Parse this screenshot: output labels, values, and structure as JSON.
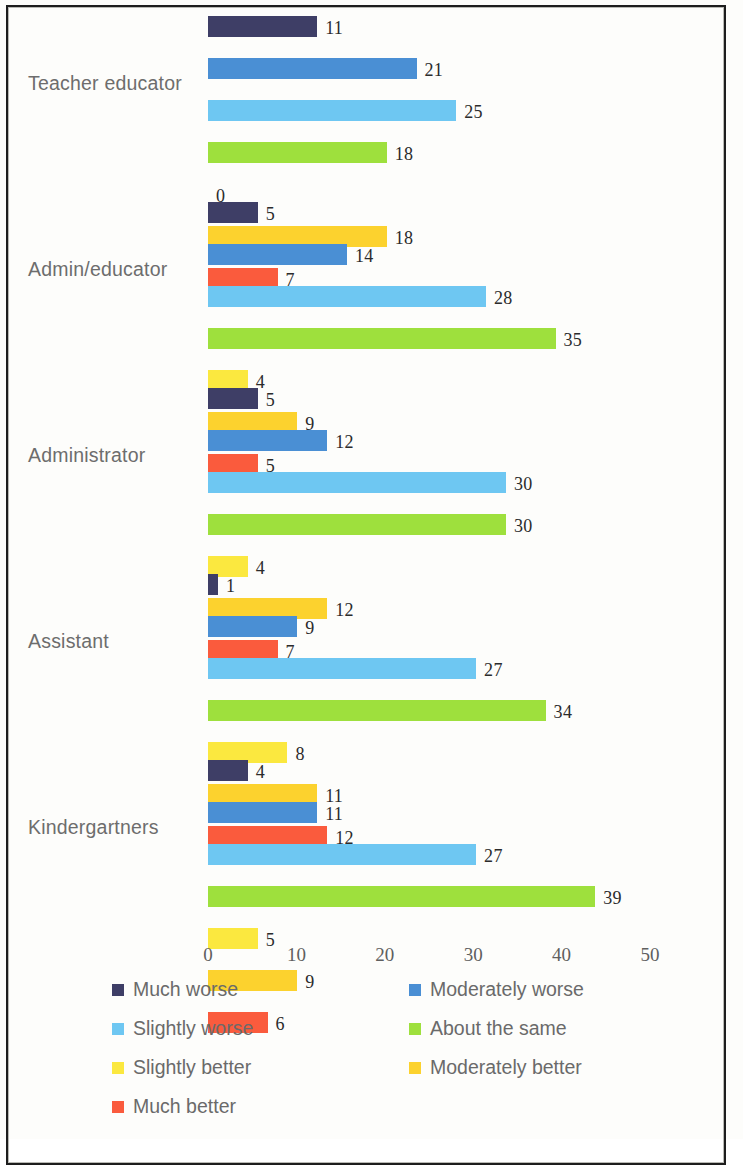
{
  "chart_data": {
    "type": "bar",
    "orientation": "horizontal",
    "title": "",
    "xlabel": "",
    "ylabel": "",
    "xlim": [
      0,
      50
    ],
    "xticks": [
      0,
      10,
      20,
      30,
      40,
      50
    ],
    "grid": false,
    "legend_position": "bottom",
    "categories": [
      "Teacher educator",
      "Admin/educator",
      "Administrator",
      "Assistant",
      "Kindergartners"
    ],
    "series": [
      {
        "name": "Much worse",
        "color": "#3e3e66",
        "values": [
          11,
          5,
          5,
          1,
          4
        ]
      },
      {
        "name": "Moderately worse",
        "color": "#4a8fd4",
        "values": [
          21,
          14,
          12,
          9,
          11
        ]
      },
      {
        "name": "Slightly worse",
        "color": "#6ec7f2",
        "values": [
          25,
          28,
          30,
          27,
          27
        ]
      },
      {
        "name": "About the same",
        "color": "#9ee03d",
        "values": [
          18,
          35,
          30,
          34,
          39
        ]
      },
      {
        "name": "Slightly better",
        "color": "#fbe83f",
        "values": [
          0,
          4,
          4,
          8,
          5
        ]
      },
      {
        "name": "Moderately better",
        "color": "#fcd22e",
        "values": [
          18,
          9,
          12,
          11,
          9
        ]
      },
      {
        "name": "Much better",
        "color": "#fa5b3d",
        "values": [
          7,
          5,
          7,
          12,
          6
        ]
      }
    ]
  },
  "axis": {
    "ticks": [
      "0",
      "10",
      "20",
      "30",
      "40",
      "50"
    ]
  },
  "legend": {
    "items": [
      {
        "label": "Much worse",
        "color": "#3e3e66"
      },
      {
        "label": "Moderately worse",
        "color": "#4a8fd4"
      },
      {
        "label": "Slightly worse",
        "color": "#6ec7f2"
      },
      {
        "label": "About the same",
        "color": "#9ee03d"
      },
      {
        "label": "Slightly better",
        "color": "#fbe83f"
      },
      {
        "label": "Moderately better",
        "color": "#fcd22e"
      },
      {
        "label": "Much better",
        "color": "#fa5b3d"
      }
    ]
  }
}
